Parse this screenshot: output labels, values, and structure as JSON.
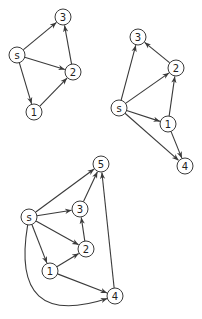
{
  "diagram": {
    "colors": {
      "stroke": "#3a3a3a",
      "node_fill": "#ffffff",
      "text": "#222222"
    },
    "node_radius": 8,
    "graphs": [
      {
        "id": "graph-1",
        "nodes": [
          {
            "id": "s",
            "label": "s",
            "x": 17,
            "y": 55
          },
          {
            "id": "3",
            "label": "3",
            "x": 63,
            "y": 17
          },
          {
            "id": "2",
            "label": "2",
            "x": 73,
            "y": 72
          },
          {
            "id": "1",
            "label": "1",
            "x": 34,
            "y": 112
          }
        ],
        "edges": [
          {
            "from": "s",
            "to": "3"
          },
          {
            "from": "s",
            "to": "2"
          },
          {
            "from": "s",
            "to": "1"
          },
          {
            "from": "2",
            "to": "3"
          },
          {
            "from": "1",
            "to": "2"
          }
        ]
      },
      {
        "id": "graph-2",
        "nodes": [
          {
            "id": "3",
            "label": "3",
            "x": 138,
            "y": 37
          },
          {
            "id": "2",
            "label": "2",
            "x": 176,
            "y": 68
          },
          {
            "id": "s",
            "label": "s",
            "x": 119,
            "y": 108
          },
          {
            "id": "1",
            "label": "1",
            "x": 168,
            "y": 124
          },
          {
            "id": "4",
            "label": "4",
            "x": 185,
            "y": 166
          }
        ],
        "edges": [
          {
            "from": "s",
            "to": "3"
          },
          {
            "from": "s",
            "to": "2"
          },
          {
            "from": "s",
            "to": "1"
          },
          {
            "from": "s",
            "to": "4"
          },
          {
            "from": "2",
            "to": "3"
          },
          {
            "from": "1",
            "to": "2"
          },
          {
            "from": "1",
            "to": "4"
          }
        ]
      },
      {
        "id": "graph-3",
        "nodes": [
          {
            "id": "5",
            "label": "5",
            "x": 101,
            "y": 164
          },
          {
            "id": "s",
            "label": "s",
            "x": 29,
            "y": 217
          },
          {
            "id": "3",
            "label": "3",
            "x": 80,
            "y": 209
          },
          {
            "id": "2",
            "label": "2",
            "x": 86,
            "y": 249
          },
          {
            "id": "1",
            "label": "1",
            "x": 50,
            "y": 271
          },
          {
            "id": "4",
            "label": "4",
            "x": 115,
            "y": 296
          }
        ],
        "edges": [
          {
            "from": "s",
            "to": "5"
          },
          {
            "from": "s",
            "to": "3"
          },
          {
            "from": "s",
            "to": "2"
          },
          {
            "from": "s",
            "to": "1"
          },
          {
            "from": "s",
            "to": "4",
            "curve": true,
            "cx": 10,
            "cy": 330
          },
          {
            "from": "3",
            "to": "5"
          },
          {
            "from": "2",
            "to": "3"
          },
          {
            "from": "1",
            "to": "2"
          },
          {
            "from": "1",
            "to": "4"
          },
          {
            "from": "4",
            "to": "5"
          }
        ]
      }
    ]
  }
}
